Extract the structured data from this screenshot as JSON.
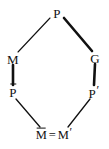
{
  "figure": {
    "kind": "hexagonal-lattice-diagram",
    "background_color": "#ffffff",
    "ink_color": "#111111",
    "width": 109,
    "height": 149
  },
  "nodes": {
    "top": {
      "id": "P",
      "label": "P",
      "x": 57,
      "y": 13
    },
    "left": {
      "id": "M",
      "label": "M",
      "x": 13,
      "y": 59
    },
    "right": {
      "id": "G",
      "label": "G",
      "x": 95,
      "y": 58
    },
    "lower_left": {
      "id": "Pbar",
      "base": "P",
      "accent": "overline",
      "label": "P̄",
      "x": 13,
      "y": 92
    },
    "lower_right": {
      "id": "Pprime",
      "base": "P",
      "accent": "prime",
      "label": "P′",
      "x": 94,
      "y": 92
    },
    "bottom": {
      "id": "Mbar_eq_Mprime",
      "left_base": "M",
      "left_accent": "overline",
      "relation": "=",
      "right_base": "M",
      "right_accent": "prime",
      "label": "M̄ = M′",
      "x": 54,
      "y": 134
    }
  },
  "edges": [
    {
      "id": "edge-P-M",
      "from": "P",
      "to": "M",
      "weight": "thin",
      "x1": 50,
      "y1": 18,
      "x2": 18,
      "y2": 52
    },
    {
      "id": "edge-P-G",
      "from": "P",
      "to": "G",
      "weight": "thick",
      "x1": 64,
      "y1": 18,
      "x2": 92,
      "y2": 51
    },
    {
      "id": "edge-M-Pbar",
      "from": "M",
      "to": "Pbar",
      "weight": "thick",
      "x1": 13,
      "y1": 65,
      "x2": 13,
      "y2": 85
    },
    {
      "id": "edge-G-Pprime",
      "from": "G",
      "to": "Pprime",
      "weight": "thick",
      "x1": 95,
      "y1": 64,
      "x2": 94,
      "y2": 85
    },
    {
      "id": "edge-Pbar-Mbar",
      "from": "Pbar",
      "to": "Mbar=Mprime",
      "weight": "thin",
      "x1": 16,
      "y1": 99,
      "x2": 40,
      "y2": 127
    },
    {
      "id": "edge-Pprime-Mprime",
      "from": "Pprime",
      "to": "Mbar=Mprime",
      "weight": "thin",
      "x1": 90,
      "y1": 99,
      "x2": 68,
      "y2": 127
    }
  ],
  "strokes": {
    "thin_width": 1.1,
    "thick_width": 2.6
  }
}
